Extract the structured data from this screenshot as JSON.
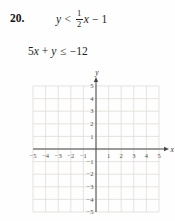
{
  "problem": {
    "number": "20.",
    "inequality1": {
      "lhs": "y",
      "relation": "<",
      "fraction_numerator": "1",
      "fraction_denominator": "2",
      "variable": "x",
      "operator": "−",
      "constant": "1"
    },
    "inequality2": {
      "coefficient": "5",
      "variable1": "x",
      "operator": "+",
      "variable2": "y",
      "relation": "≤",
      "rhs": "−12"
    }
  },
  "chart_data": {
    "type": "scatter",
    "title": "",
    "xlabel": "x",
    "ylabel": "y",
    "xlim": [
      -5,
      5
    ],
    "ylim": [
      -5,
      5
    ],
    "grid": true,
    "series": [],
    "x_tick_values": [
      -5,
      -4,
      -3,
      -2,
      -1,
      1,
      2,
      3,
      4,
      5
    ],
    "x_tick_labels": [
      "−5",
      "−4",
      "−3",
      "−2",
      "−1",
      "1",
      "2",
      "3",
      "4",
      "5"
    ],
    "y_tick_values": [
      5,
      4,
      3,
      2,
      1,
      -1,
      -2,
      -3,
      -4,
      -5
    ],
    "y_tick_labels": [
      "5",
      "4",
      "3",
      "2",
      "1",
      "−1",
      "−2",
      "−3",
      "−4",
      "−5"
    ],
    "grid_color": "#dcd9d3",
    "axis_color": "#474747",
    "tick_label_color": "#4d4d4d",
    "axis_label_color": "#333333"
  }
}
